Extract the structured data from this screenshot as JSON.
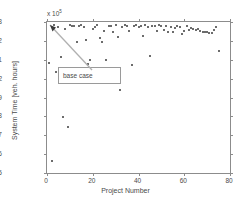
{
  "chart_data": {
    "type": "scatter",
    "title": "",
    "xlabel": "Project Number",
    "ylabel": "System Time [veh. hours]",
    "y_exponent_label": "x 10",
    "y_exponent_power": "5",
    "xlim": [
      0,
      80
    ],
    "ylim": [
      1.995,
      2.003
    ],
    "xticks": [
      "0",
      "20",
      "40",
      "60",
      "80"
    ],
    "xtick_values": [
      0,
      20,
      40,
      60,
      80
    ],
    "yticks": [
      "1.995",
      "1.996",
      "1.997",
      "1.998",
      "1.999",
      "2",
      "2.001",
      "2.002",
      "2.003"
    ],
    "ytick_values": [
      1.995,
      1.996,
      1.997,
      1.998,
      1.999,
      2.0,
      2.001,
      2.002,
      2.003
    ],
    "grid": false,
    "legend": null,
    "marker": "dot",
    "marker_color": "#3b3b3b",
    "annotations": [
      {
        "text": "base case",
        "box_x": 11,
        "box_y": 1.99965,
        "points_to_x": 3,
        "points_to_y": 2.00285
      }
    ],
    "x": [
      1,
      2,
      3,
      4,
      5,
      6,
      7,
      8,
      9,
      10,
      11,
      12,
      13,
      14,
      15,
      16,
      17,
      18,
      19,
      20,
      21,
      22,
      23,
      24,
      25,
      26,
      27,
      28,
      29,
      30,
      31,
      32,
      33,
      34,
      35,
      36,
      37,
      38,
      39,
      40,
      41,
      42,
      43,
      44,
      45,
      46,
      47,
      48,
      49,
      50,
      51,
      52,
      53,
      54,
      55,
      56,
      57,
      58,
      59,
      60,
      61,
      62,
      63,
      64,
      65,
      66,
      67,
      68,
      69,
      70,
      71,
      72,
      73,
      74,
      75
    ],
    "y": [
      2.00085,
      1.99565,
      2.00285,
      2.00035,
      2.00275,
      2.00115,
      1.99795,
      2.00265,
      1.99742,
      2.00282,
      2.00281,
      2.00278,
      2.00196,
      2.00279,
      2.00283,
      2.00276,
      2.00205,
      2.00078,
      2.00098,
      2.00262,
      2.00272,
      2.00283,
      2.00214,
      2.00192,
      2.00254,
      2.00099,
      2.00278,
      2.00281,
      2.00249,
      2.00283,
      2.00219,
      1.99938,
      2.00275,
      2.00283,
      2.00281,
      2.00252,
      2.00073,
      2.00279,
      2.00283,
      2.00272,
      2.00281,
      2.00225,
      2.00283,
      2.00276,
      2.00122,
      2.00279,
      2.00281,
      2.00253,
      2.00284,
      2.00278,
      2.00259,
      2.00281,
      2.00249,
      2.00272,
      2.00247,
      2.00268,
      2.00281,
      2.00274,
      2.00237,
      2.00252,
      2.00278,
      2.00259,
      2.00266,
      2.00261,
      2.00258,
      2.00264,
      2.00252,
      2.00249,
      2.00248,
      2.00246,
      2.00244,
      2.00242,
      2.00258,
      2.00272,
      2.00148
    ]
  }
}
